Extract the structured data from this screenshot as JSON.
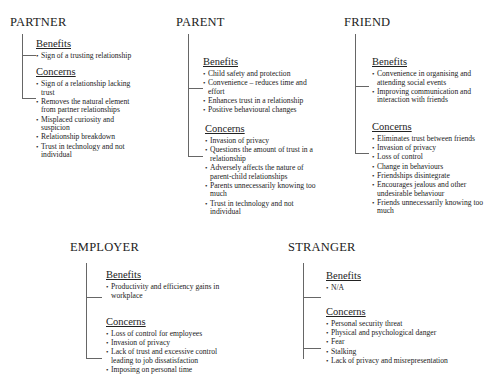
{
  "groups": {
    "partner": {
      "title": "PARTNER",
      "benefits_label": "Benefits",
      "benefits": [
        "Sign of a trusting relationship"
      ],
      "concerns_label": "Concerns",
      "concerns": [
        "Sign of a relationship lacking trust",
        "Removes the natural element from partner relationships",
        "Misplaced curiosity and suspicion",
        "Relationship breakdown",
        "Trust in technology and not individual"
      ]
    },
    "parent": {
      "title": "PARENT",
      "benefits_label": "Benefits",
      "benefits": [
        "Child safety and protection",
        "Convenience – reduces time and effort",
        "Enhances trust in a relationship",
        "Positive behavioural changes"
      ],
      "concerns_label": "Concerns",
      "concerns": [
        "Invasion of privacy",
        "Questions the amount of trust in a relationship",
        "Adversely affects the nature of parent-child relationships",
        "Parents unnecessarily knowing too much",
        "Trust in technology and not individual"
      ]
    },
    "friend": {
      "title": "FRIEND",
      "benefits_label": "Benefits",
      "benefits": [
        "Convenience in organising and attending social events",
        "Improving communication and interaction with friends"
      ],
      "concerns_label": "Concerns",
      "concerns": [
        "Eliminates trust between friends",
        "Invasion of privacy",
        "Loss of control",
        "Change in behaviours",
        "Friendships disintegrate",
        "Encourages jealous and other undesirable behaviour",
        "Friends unnecessarily knowing too much"
      ]
    },
    "employer": {
      "title": "EMPLOYER",
      "benefits_label": "Benefits",
      "benefits": [
        "Productivity and efficiency gains in workplace"
      ],
      "concerns_label": "Concerns",
      "concerns": [
        "Loss of control for employees",
        "Invasion of privacy",
        "Lack of trust and excessive control leading to job dissatisfaction",
        "Imposing on personal time"
      ]
    },
    "stranger": {
      "title": "STRANGER",
      "benefits_label": "Benefits",
      "benefits": [
        "N/A"
      ],
      "concerns_label": "Concerns",
      "concerns": [
        "Personal security threat",
        "Physical and psychological danger",
        "Fear",
        "Stalking",
        "Lack of privacy and misrepresentation"
      ]
    }
  }
}
